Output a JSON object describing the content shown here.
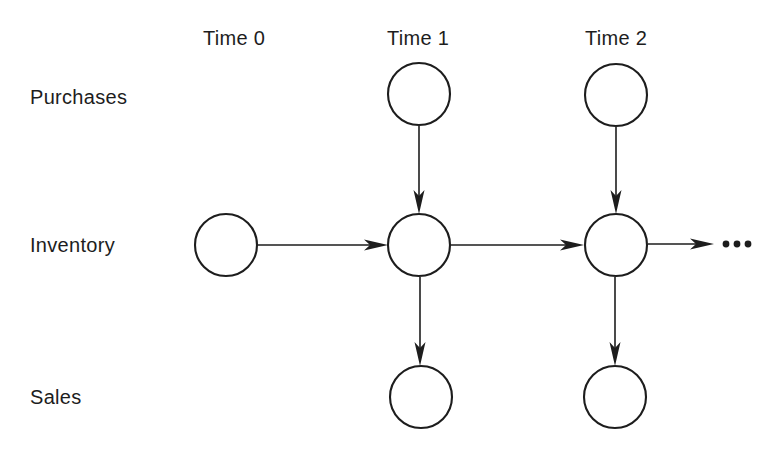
{
  "diagram": {
    "background_color": "#ffffff",
    "stroke_color": "#1d1d1d",
    "column_headers": [
      {
        "label": "Time 0",
        "x": 234,
        "y": 38
      },
      {
        "label": "Time 1",
        "x": 418,
        "y": 38
      },
      {
        "label": "Time 2",
        "x": 616,
        "y": 38
      }
    ],
    "row_labels": [
      {
        "label": "Purchases",
        "x": 30,
        "y": 97
      },
      {
        "label": "Inventory",
        "x": 30,
        "y": 245
      },
      {
        "label": "Sales",
        "x": 30,
        "y": 397
      }
    ],
    "nodes": [
      {
        "id": "inventory-t0",
        "row": "Inventory",
        "time": "Time 0",
        "cx": 226,
        "cy": 245,
        "r": 31
      },
      {
        "id": "purchases-t1",
        "row": "Purchases",
        "time": "Time 1",
        "cx": 419,
        "cy": 94,
        "r": 31
      },
      {
        "id": "inventory-t1",
        "row": "Inventory",
        "time": "Time 1",
        "cx": 419,
        "cy": 245,
        "r": 31
      },
      {
        "id": "sales-t1",
        "row": "Sales",
        "time": "Time 1",
        "cx": 421,
        "cy": 397,
        "r": 31
      },
      {
        "id": "purchases-t2",
        "row": "Purchases",
        "time": "Time 2",
        "cx": 616,
        "cy": 95,
        "r": 31
      },
      {
        "id": "inventory-t2",
        "row": "Inventory",
        "time": "Time 2",
        "cx": 616,
        "cy": 245,
        "r": 31
      },
      {
        "id": "sales-t2",
        "row": "Sales",
        "time": "Time 2",
        "cx": 615,
        "cy": 397,
        "r": 31
      }
    ],
    "edges": [
      {
        "id": "inv-t0-to-inv-t1",
        "from": "inventory-t0",
        "to": "inventory-t1",
        "direction": "right"
      },
      {
        "id": "pur-t1-to-inv-t1",
        "from": "purchases-t1",
        "to": "inventory-t1",
        "direction": "down"
      },
      {
        "id": "inv-t1-to-sales-t1",
        "from": "inventory-t1",
        "to": "sales-t1",
        "direction": "down"
      },
      {
        "id": "inv-t1-to-inv-t2",
        "from": "inventory-t1",
        "to": "inventory-t2",
        "direction": "right"
      },
      {
        "id": "pur-t2-to-inv-t2",
        "from": "purchases-t2",
        "to": "inventory-t2",
        "direction": "down"
      },
      {
        "id": "inv-t2-to-sales-t2",
        "from": "inventory-t2",
        "to": "sales-t2",
        "direction": "down"
      },
      {
        "id": "inv-t2-to-future",
        "from": "inventory-t2",
        "to": "continuation",
        "direction": "right"
      }
    ],
    "continuation": {
      "label": "...",
      "x": 737,
      "y": 244,
      "dot_count": 3
    }
  }
}
